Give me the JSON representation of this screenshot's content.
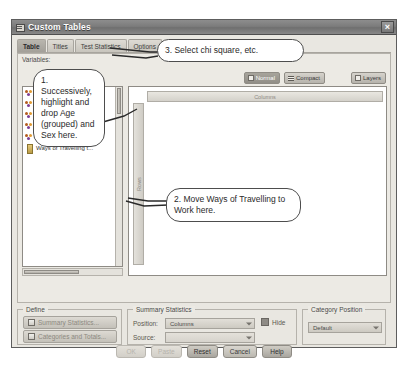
{
  "window": {
    "title": "Custom Tables",
    "icon": "table-window-icon",
    "close_label": "×"
  },
  "tabs": [
    {
      "label": "Table",
      "active": true
    },
    {
      "label": "Titles",
      "active": false
    },
    {
      "label": "Test Statistics",
      "active": false
    },
    {
      "label": "Options",
      "active": false
    }
  ],
  "variables_panel": {
    "label": "Variables:",
    "items": [
      {
        "name": "Do you take the bus ...",
        "measure": "nominal"
      },
      {
        "name": "Do you drive a car? [...",
        "measure": "nominal"
      },
      {
        "name": "Do you drive a motor...",
        "measure": "nominal"
      },
      {
        "name": "Do you come by car ...",
        "measure": "nominal"
      },
      {
        "name": "Do you come by trai...",
        "measure": "nominal"
      },
      {
        "name": "Ways of Travelling t...",
        "measure": "scale"
      }
    ]
  },
  "view_buttons": [
    {
      "label": "Normal",
      "icon": "normal-view-icon",
      "state": "on"
    },
    {
      "label": "Compact",
      "icon": "compact-view-icon",
      "state": "off"
    },
    {
      "label": "Layers",
      "icon": "layers-view-icon",
      "state": "off"
    }
  ],
  "canvas": {
    "columns_label": "Columns",
    "rows_label": "Rows"
  },
  "define_group": {
    "legend": "Define",
    "buttons": [
      {
        "label": "Summary Statistics...",
        "icon": "summary-statistics-icon"
      },
      {
        "label": "Categories and Totals...",
        "icon": "categories-totals-icon"
      }
    ]
  },
  "summary_statistics_group": {
    "legend": "Summary Statistics",
    "position_label": "Position:",
    "position_value": "Columns",
    "source_label": "Source:",
    "source_value": "",
    "hide_label": "Hide",
    "hide_checked": true
  },
  "category_position_group": {
    "legend": "Category Position",
    "value": "Default"
  },
  "dialog_buttons": [
    {
      "label": "OK",
      "state": "disabled"
    },
    {
      "label": "Paste",
      "state": "disabled"
    },
    {
      "label": "Reset",
      "state": "strong"
    },
    {
      "label": "Cancel",
      "state": "normal"
    },
    {
      "label": "Help",
      "state": "strong"
    }
  ],
  "callouts": [
    {
      "id": "callout-1",
      "text": "1. Successively, highlight and drop Age (grouped) and Sex here."
    },
    {
      "id": "callout-2",
      "text": "2. Move Ways of Travelling to Work here."
    },
    {
      "id": "callout-3",
      "text": "3. Select chi square, etc."
    }
  ],
  "colors": {
    "window_bg": "#eceae4",
    "titlebar": "#7c7c7c",
    "callout_border": "#4d4d4d",
    "canvas_bg": "#ffffff"
  }
}
